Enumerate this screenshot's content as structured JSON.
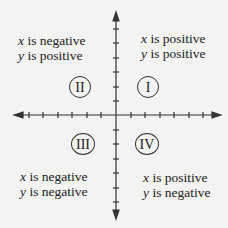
{
  "quadrants": {
    "q1": {
      "numeral": "I",
      "x_var": "x",
      "x_text": " is positive",
      "y_var": "y",
      "y_text": " is positive"
    },
    "q2": {
      "numeral": "II",
      "x_var": "x",
      "x_text": " is negative",
      "y_var": "y",
      "y_text": " is positive"
    },
    "q3": {
      "numeral": "III",
      "x_var": "x",
      "x_text": " is negative",
      "y_var": "y",
      "y_text": " is negative"
    },
    "q4": {
      "numeral": "IV",
      "x_var": "x",
      "x_text": " is positive",
      "y_var": "y",
      "y_text": " is negative"
    }
  },
  "axes": {
    "color": "#333333",
    "tick_count_each_side": 6
  }
}
